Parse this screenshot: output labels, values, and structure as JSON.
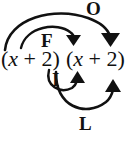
{
  "diagram": {
    "name": "FOIL method diagram",
    "method": "FOIL",
    "expression": {
      "left_factor": "(x + 2)",
      "right_factor": "(x + 2)",
      "full": "(x + 2)(x + 2)"
    },
    "ink_color": "#111111",
    "background_color": "#ffffff",
    "labels": {
      "first": "F",
      "outer": "O",
      "inner": "I",
      "last": "L"
    },
    "arrows": [
      {
        "label": "F",
        "meaning": "First",
        "from": "x in left factor",
        "to": "x in right factor",
        "direction": "over-the-top",
        "arrowhead": "down"
      },
      {
        "label": "O",
        "meaning": "Outer",
        "from": "x in left factor",
        "to": "2 in right factor",
        "direction": "over-the-top",
        "arrowhead": "down"
      },
      {
        "label": "I",
        "meaning": "Inner",
        "from": "2 in left factor",
        "to": "x in right factor",
        "direction": "under-the-bottom",
        "arrowhead": "up"
      },
      {
        "label": "L",
        "meaning": "Last",
        "from": "2 in left factor",
        "to": "2 in right factor",
        "direction": "under-the-bottom",
        "arrowhead": "up"
      }
    ]
  }
}
